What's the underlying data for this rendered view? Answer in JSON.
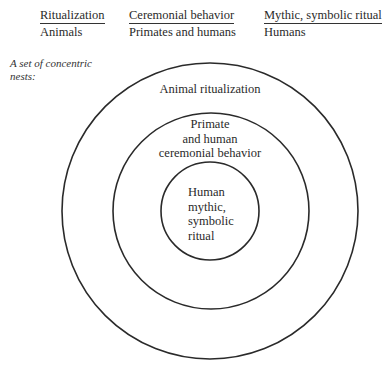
{
  "header": {
    "columns": [
      {
        "top": "Ritualization",
        "bottom": "Animals"
      },
      {
        "top": "Ceremonial behavior",
        "bottom": "Primates and humans"
      },
      {
        "top": "Mythic, symbolic ritual",
        "bottom": "Humans"
      }
    ]
  },
  "annotation": {
    "lines": [
      "A set of concentric",
      "nests:"
    ]
  },
  "diagram": {
    "type": "concentric-circles",
    "stroke_color": "#2a2a2a",
    "rings": [
      {
        "name": "outer",
        "label_lines": [
          "Animal ritualization"
        ],
        "cx": 210,
        "cy": 211,
        "r": 148
      },
      {
        "name": "middle",
        "label_lines": [
          "Primate",
          "and human",
          "ceremonial behavior"
        ],
        "cx": 211,
        "cy": 211,
        "r": 98
      },
      {
        "name": "inner",
        "label_lines": [
          "Human",
          "mythic,",
          "symbolic",
          "ritual"
        ],
        "cx": 210,
        "cy": 211,
        "r": 49
      }
    ]
  }
}
